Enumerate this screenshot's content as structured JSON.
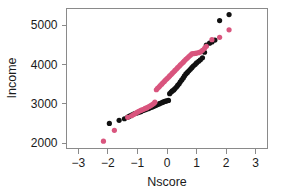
{
  "chart_data": {
    "type": "scatter",
    "title": "",
    "subtitle": "",
    "xlabel": "Nscore",
    "ylabel": "Income",
    "xlim": [
      -3.4,
      3.4
    ],
    "ylim": [
      1870,
      5420
    ],
    "xticks": [
      -3,
      -2,
      -1,
      0,
      1,
      2,
      3
    ],
    "xtick_labels": [
      "−3",
      "−2",
      "−1",
      "0",
      "1",
      "2",
      "3"
    ],
    "yticks": [
      2000,
      3000,
      4000,
      5000
    ],
    "ytick_labels": [
      "2000",
      "3000",
      "4000",
      "5000"
    ],
    "grid": false,
    "legend": "none",
    "frame": "box",
    "marker_radius_px": 2.6,
    "series": [
      {
        "name": "black",
        "color": "#111111",
        "marker": "filled-circle",
        "points": [
          [
            -1.95,
            2505
          ],
          [
            -1.62,
            2585
          ],
          [
            -1.44,
            2625
          ],
          [
            -1.33,
            2665
          ],
          [
            -1.27,
            2690
          ],
          [
            -1.2,
            2720
          ],
          [
            -1.13,
            2745
          ],
          [
            -1.07,
            2760
          ],
          [
            -1.0,
            2775
          ],
          [
            -0.95,
            2790
          ],
          [
            -0.89,
            2805
          ],
          [
            -0.84,
            2825
          ],
          [
            -0.79,
            2840
          ],
          [
            -0.74,
            2855
          ],
          [
            -0.69,
            2870
          ],
          [
            -0.64,
            2880
          ],
          [
            -0.59,
            2895
          ],
          [
            -0.55,
            2910
          ],
          [
            -0.5,
            2925
          ],
          [
            -0.45,
            2940
          ],
          [
            -0.41,
            2955
          ],
          [
            -0.36,
            2970
          ],
          [
            -0.32,
            2985
          ],
          [
            -0.27,
            3000
          ],
          [
            -0.23,
            3015
          ],
          [
            -0.18,
            3030
          ],
          [
            -0.14,
            3045
          ],
          [
            -0.09,
            3060
          ],
          [
            -0.05,
            3070
          ],
          [
            0.0,
            3080
          ],
          [
            0.05,
            3090
          ],
          [
            0.09,
            3260
          ],
          [
            0.14,
            3300
          ],
          [
            0.18,
            3330
          ],
          [
            0.23,
            3355
          ],
          [
            0.27,
            3390
          ],
          [
            0.32,
            3430
          ],
          [
            0.36,
            3470
          ],
          [
            0.41,
            3510
          ],
          [
            0.45,
            3560
          ],
          [
            0.5,
            3610
          ],
          [
            0.55,
            3660
          ],
          [
            0.59,
            3710
          ],
          [
            0.64,
            3760
          ],
          [
            0.69,
            3800
          ],
          [
            0.74,
            3840
          ],
          [
            0.79,
            3880
          ],
          [
            0.84,
            3920
          ],
          [
            0.89,
            3960
          ],
          [
            0.95,
            4000
          ],
          [
            1.0,
            4040
          ],
          [
            1.07,
            4080
          ],
          [
            1.13,
            4120
          ],
          [
            1.2,
            4170
          ],
          [
            1.27,
            4310
          ],
          [
            1.33,
            4490
          ],
          [
            1.44,
            4540
          ],
          [
            1.52,
            4570
          ],
          [
            1.62,
            4620
          ],
          [
            1.78,
            5115
          ],
          [
            2.1,
            5265
          ]
        ]
      },
      {
        "name": "pink",
        "color": "#d9557e",
        "marker": "filled-circle",
        "points": [
          [
            -2.15,
            2055
          ],
          [
            -1.78,
            2330
          ],
          [
            -1.33,
            2660
          ],
          [
            -1.2,
            2700
          ],
          [
            -1.13,
            2730
          ],
          [
            -1.07,
            2760
          ],
          [
            -1.0,
            2790
          ],
          [
            -0.95,
            2815
          ],
          [
            -0.89,
            2835
          ],
          [
            -0.84,
            2850
          ],
          [
            -0.79,
            2865
          ],
          [
            -0.74,
            2885
          ],
          [
            -0.69,
            2900
          ],
          [
            -0.64,
            2920
          ],
          [
            -0.59,
            2940
          ],
          [
            -0.55,
            2960
          ],
          [
            -0.5,
            2985
          ],
          [
            -0.45,
            3010
          ],
          [
            -0.41,
            3045
          ],
          [
            -0.36,
            3360
          ],
          [
            -0.32,
            3395
          ],
          [
            -0.27,
            3430
          ],
          [
            -0.23,
            3465
          ],
          [
            -0.18,
            3500
          ],
          [
            -0.14,
            3535
          ],
          [
            -0.09,
            3570
          ],
          [
            -0.05,
            3605
          ],
          [
            0.0,
            3640
          ],
          [
            0.05,
            3675
          ],
          [
            0.09,
            3710
          ],
          [
            0.14,
            3745
          ],
          [
            0.18,
            3780
          ],
          [
            0.23,
            3815
          ],
          [
            0.27,
            3850
          ],
          [
            0.32,
            3885
          ],
          [
            0.36,
            3920
          ],
          [
            0.41,
            3955
          ],
          [
            0.45,
            3990
          ],
          [
            0.5,
            4025
          ],
          [
            0.55,
            4060
          ],
          [
            0.59,
            4095
          ],
          [
            0.64,
            4130
          ],
          [
            0.69,
            4165
          ],
          [
            0.74,
            4200
          ],
          [
            0.79,
            4235
          ],
          [
            0.84,
            4270
          ],
          [
            0.89,
            4275
          ],
          [
            0.95,
            4280
          ],
          [
            1.0,
            4290
          ],
          [
            1.07,
            4300
          ],
          [
            1.13,
            4320
          ],
          [
            1.2,
            4360
          ],
          [
            1.27,
            4410
          ],
          [
            1.33,
            4460
          ],
          [
            1.52,
            4630
          ],
          [
            1.78,
            4690
          ],
          [
            2.1,
            4880
          ]
        ]
      }
    ]
  }
}
